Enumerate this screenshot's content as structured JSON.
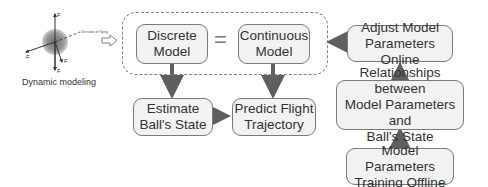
{
  "dynamic_modeling": {
    "caption": "Dynamic modeling",
    "force_labels": [
      "F_z",
      "F_l",
      "F_d",
      "F_g"
    ],
    "direction_label": "Direction of flying"
  },
  "boxes": {
    "discrete_model": "Discrete\nModel",
    "continuous_model": "Continuous\nModel",
    "estimate_state": "Estimate\nBall's State",
    "predict_trajectory": "Predict Flight\nTrajectory",
    "adjust_params": "Adjust Model\nParameters Online",
    "relationships": "Relationships between\nModel Parameters and\nBall's State",
    "training_offline": "Model Parameters\nTraining Offline"
  },
  "equals_sign": "=",
  "colors": {
    "box_fill": "#f2f2f2",
    "box_border": "#7a7a7a",
    "arrow": "#5f5f5f",
    "dashed": "#808080"
  }
}
